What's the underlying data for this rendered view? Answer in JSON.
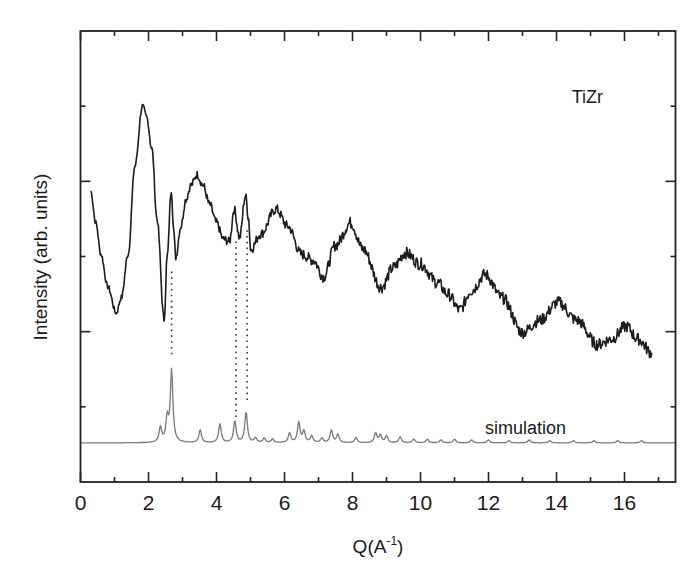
{
  "chart_data": {
    "type": "line",
    "title": "",
    "xlabel": "Q(A⁻¹)",
    "xlabel_main": "Q(A",
    "xlabel_sup": "-1",
    "xlabel_close": ")",
    "ylabel": "Intensity (arb. units)",
    "xlim": [
      0,
      17.5
    ],
    "ylim": [
      0,
      6
    ],
    "x_ticks": [
      "0",
      "2",
      "4",
      "6",
      "8",
      "10",
      "12",
      "14",
      "16"
    ],
    "x_tick_values": [
      0,
      2,
      4,
      6,
      8,
      10,
      12,
      14,
      16
    ],
    "x_minor_ticks": [
      1,
      3,
      5,
      7,
      9,
      11,
      13,
      15,
      17
    ],
    "y_major_ticks": [
      2,
      4
    ],
    "y_minor_ticks": [
      1,
      3,
      5
    ],
    "y_tick_labels": [],
    "grid": false,
    "legend": null,
    "annotations": [
      {
        "text": "TiZr",
        "x": 14.45,
        "y": 5.13
      },
      {
        "text": "simulation",
        "x": 11.9,
        "y": 0.72
      }
    ],
    "guide_lines": [
      {
        "q": 2.68,
        "y_from": 1.66,
        "y_to": 2.8
      },
      {
        "q": 4.57,
        "y_from": 0.85,
        "y_to": 3.2
      },
      {
        "q": 4.9,
        "y_from": 1.05,
        "y_to": 3.35
      }
    ],
    "series": [
      {
        "name": "TiZr",
        "style": "experimental",
        "x": [
          0.3,
          0.45,
          0.6,
          0.8,
          1.05,
          1.2,
          1.4,
          1.6,
          1.82,
          1.95,
          2.1,
          2.25,
          2.46,
          2.55,
          2.67,
          2.75,
          2.8,
          2.95,
          3.1,
          3.25,
          3.43,
          3.6,
          3.8,
          4.0,
          4.2,
          4.38,
          4.52,
          4.68,
          4.85,
          4.95,
          5.0,
          5.3,
          5.75,
          6.1,
          6.5,
          6.85,
          7.15,
          7.5,
          7.95,
          8.3,
          8.85,
          9.2,
          9.55,
          10.0,
          10.5,
          10.8,
          11.15,
          11.5,
          11.9,
          12.4,
          13.0,
          13.5,
          14.05,
          14.6,
          15.2,
          15.6,
          16.05,
          16.4,
          16.8
        ],
        "values": [
          3.87,
          3.45,
          3.03,
          2.6,
          2.25,
          2.45,
          3.03,
          4.2,
          5.0,
          4.85,
          4.43,
          3.5,
          2.16,
          3.0,
          3.89,
          3.3,
          2.99,
          3.4,
          3.76,
          3.95,
          4.09,
          3.95,
          3.69,
          3.45,
          3.23,
          3.2,
          3.63,
          3.25,
          3.81,
          3.5,
          3.09,
          3.3,
          3.63,
          3.4,
          3.03,
          2.95,
          2.73,
          3.15,
          3.45,
          3.1,
          2.59,
          2.85,
          3.05,
          2.9,
          2.65,
          2.5,
          2.29,
          2.55,
          2.76,
          2.45,
          1.99,
          2.15,
          2.39,
          2.15,
          1.83,
          1.9,
          2.07,
          1.9,
          1.72
        ]
      },
      {
        "name": "simulation",
        "style": "simulated",
        "baseline": 0.52,
        "peaks": [
          {
            "q": 2.35,
            "h": 0.72
          },
          {
            "q": 2.55,
            "h": 0.83
          },
          {
            "q": 2.68,
            "h": 1.48
          },
          {
            "q": 3.52,
            "h": 0.69
          },
          {
            "q": 4.1,
            "h": 0.77
          },
          {
            "q": 4.54,
            "h": 0.81
          },
          {
            "q": 4.87,
            "h": 0.93
          },
          {
            "q": 5.15,
            "h": 0.58
          },
          {
            "q": 5.4,
            "h": 0.58
          },
          {
            "q": 5.65,
            "h": 0.57
          },
          {
            "q": 6.15,
            "h": 0.65
          },
          {
            "q": 6.42,
            "h": 0.79
          },
          {
            "q": 6.57,
            "h": 0.67
          },
          {
            "q": 6.8,
            "h": 0.61
          },
          {
            "q": 7.1,
            "h": 0.58
          },
          {
            "q": 7.38,
            "h": 0.69
          },
          {
            "q": 7.57,
            "h": 0.63
          },
          {
            "q": 8.1,
            "h": 0.59
          },
          {
            "q": 8.68,
            "h": 0.65
          },
          {
            "q": 8.82,
            "h": 0.62
          },
          {
            "q": 9.0,
            "h": 0.61
          },
          {
            "q": 9.4,
            "h": 0.6
          },
          {
            "q": 9.8,
            "h": 0.57
          },
          {
            "q": 10.2,
            "h": 0.57
          },
          {
            "q": 10.6,
            "h": 0.56
          },
          {
            "q": 11.0,
            "h": 0.57
          },
          {
            "q": 11.5,
            "h": 0.56
          },
          {
            "q": 12.0,
            "h": 0.56
          },
          {
            "q": 12.6,
            "h": 0.55
          },
          {
            "q": 13.2,
            "h": 0.56
          },
          {
            "q": 13.8,
            "h": 0.55
          },
          {
            "q": 14.5,
            "h": 0.55
          },
          {
            "q": 15.1,
            "h": 0.55
          },
          {
            "q": 15.8,
            "h": 0.55
          },
          {
            "q": 16.5,
            "h": 0.55
          }
        ],
        "x_range": [
          0.0,
          17.5
        ]
      }
    ]
  }
}
